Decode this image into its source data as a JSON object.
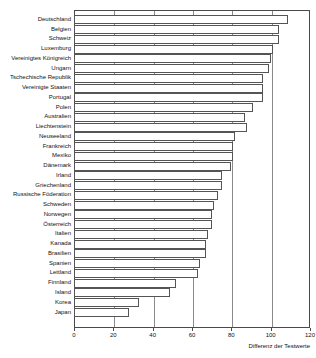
{
  "chart_data": {
    "type": "bar",
    "orientation": "horizontal",
    "title": "",
    "subtitle": "",
    "xlabel": "Differenz der Testwerte",
    "ylabel": "",
    "xlim": [
      0,
      120
    ],
    "ylim": null,
    "xticks": [
      0,
      20,
      40,
      60,
      80,
      100,
      120
    ],
    "xticklabels": [
      "0",
      "20",
      "40",
      "60",
      "80",
      "100",
      "120"
    ],
    "grid": "vertical",
    "legend": null,
    "legend_position": "none",
    "bar_fill": "#ffffff",
    "bar_edge": "#555555",
    "categories": [
      "Deutschland",
      "Belgien",
      "Schweiz",
      "Luxemburg",
      "Vereinigtes Königreich",
      "Ungarn",
      "Tschechische Republik",
      "Vereinigte Staaten",
      "Portugal",
      "Polen",
      "Australien",
      "Liechtenstein",
      "Neuseeland",
      "Frankreich",
      "Mexiko",
      "Dänemark",
      "Irland",
      "Griechenland",
      "Russische Föderation",
      "Schweden",
      "Norwegen",
      "Österreich",
      "Italien",
      "Kanada",
      "Brasilien",
      "Spanien",
      "Lettland",
      "Finnland",
      "Island",
      "Korea",
      "Japan"
    ],
    "values": [
      109,
      104,
      104,
      101,
      100,
      99,
      96,
      96,
      96,
      91,
      87,
      88,
      82,
      81,
      81,
      80,
      75,
      75,
      73,
      71,
      70,
      70,
      68,
      67,
      67,
      64,
      63,
      52,
      49,
      33,
      28
    ]
  }
}
